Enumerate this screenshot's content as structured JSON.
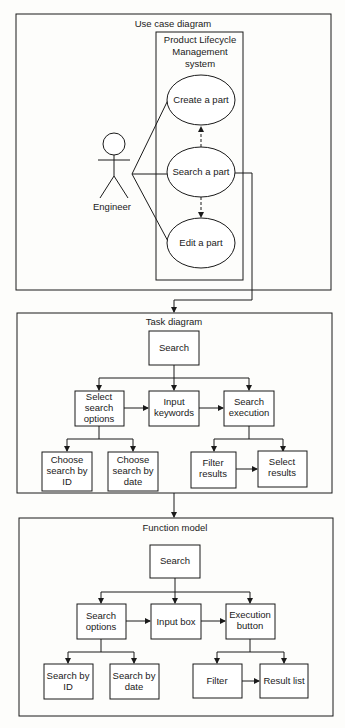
{
  "use_case": {
    "title": "Use case diagram",
    "system": [
      "Product Lifecycle",
      "Management",
      "system"
    ],
    "actor": "Engineer",
    "cases": [
      "Create a part",
      "Search a part",
      "Edit a part"
    ]
  },
  "task": {
    "title": "Task diagram",
    "root": "Search",
    "mid": [
      [
        "Select",
        "search",
        "options"
      ],
      [
        "Input",
        "keywords"
      ],
      [
        "Search",
        "execution"
      ]
    ],
    "leaves": [
      [
        "Choose",
        "search by",
        "ID"
      ],
      [
        "Choose",
        "search by",
        "date"
      ],
      [
        "Filter",
        "results"
      ],
      [
        "Select",
        "results"
      ]
    ]
  },
  "function": {
    "title": "Function model",
    "root": "Search",
    "mid": [
      [
        "Search",
        "options"
      ],
      [
        "Input box"
      ],
      [
        "Execution",
        "button"
      ]
    ],
    "leaves": [
      [
        "Search by",
        "ID"
      ],
      [
        "Search by",
        "date"
      ],
      [
        "Filter"
      ],
      [
        "Result list"
      ]
    ]
  }
}
